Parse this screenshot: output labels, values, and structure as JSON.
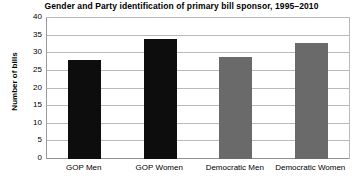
{
  "chart_data": {
    "type": "bar",
    "title": "Gender and Party identification of primary bill sponsor, 1995–2010",
    "xlabel": "",
    "ylabel": "Number of bills",
    "categories": [
      "GOP Men",
      "GOP Women",
      "Democratic Men",
      "Democratic Women"
    ],
    "values": [
      28,
      34,
      29,
      33
    ],
    "series": [
      {
        "name": "Number of bills",
        "values": [
          28,
          34,
          29,
          33
        ]
      }
    ],
    "bar_colors": [
      "#0d0d0d",
      "#0d0d0d",
      "#6a6a6a",
      "#6a6a6a"
    ],
    "ylim": [
      0,
      40
    ],
    "yticks": [
      0,
      5,
      10,
      15,
      20,
      25,
      30,
      35,
      40
    ],
    "ytick_labels": [
      "0",
      "5",
      "10",
      "15",
      "20",
      "25",
      "30",
      "35",
      "40"
    ],
    "grid": true,
    "grid_axis": "y",
    "legend": false,
    "legend_position": "none",
    "background_color": "#ffffff",
    "grid_color": "#b9b9b9",
    "axis_color": "#8f8f8f",
    "text_color": "#000000"
  }
}
